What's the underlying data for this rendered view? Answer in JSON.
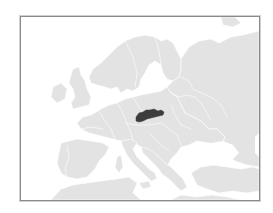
{
  "map": {
    "region": "Europe",
    "highlighted_country": "Slovakia",
    "colors": {
      "background": "#ffffff",
      "sea": "#ffffff",
      "land": "#e3e3e3",
      "borders": "#ffffff",
      "highlight": "#3c3c3c",
      "frame": "#8a8a8a"
    }
  }
}
